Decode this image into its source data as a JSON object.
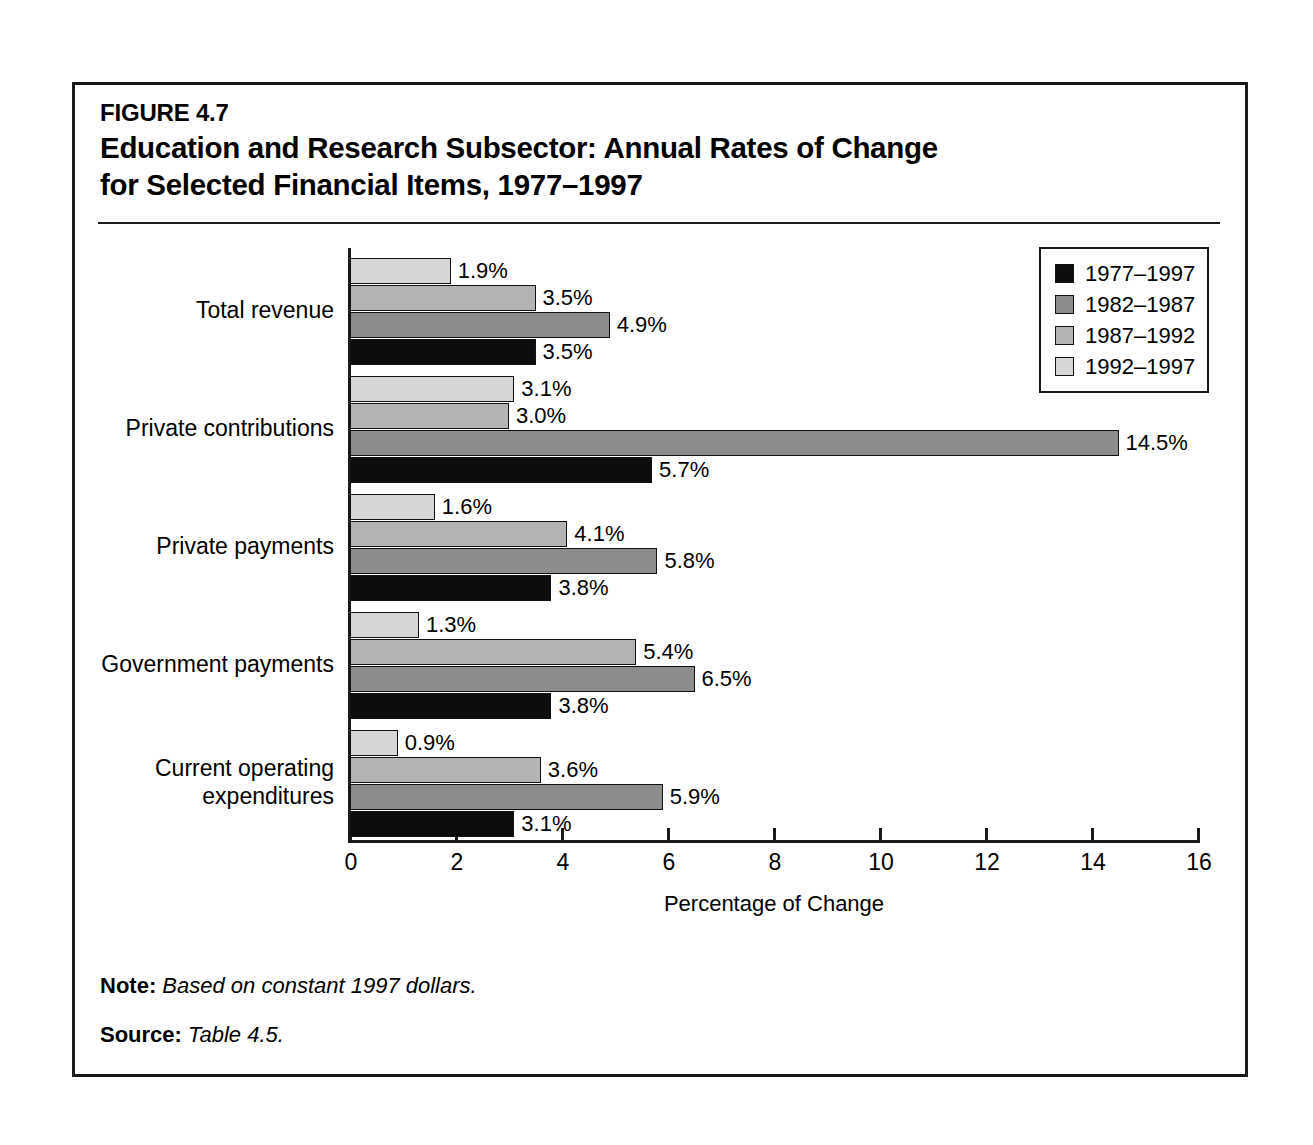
{
  "figure": {
    "number": "FIGURE 4.7",
    "title_line1": "Education and Research Subsector: Annual Rates of Change",
    "title_line2": "for Selected Financial Items, 1977–1997"
  },
  "notes": {
    "note_label": "Note:",
    "note_text": "Based on constant 1997 dollars.",
    "source_label": "Source:",
    "source_text": "Table 4.5."
  },
  "legend": {
    "position": "top-right",
    "entries": [
      {
        "label": "1977–1997",
        "color": "#0d0d0d"
      },
      {
        "label": "1982–1987",
        "color": "#8c8c8c"
      },
      {
        "label": "1987–1992",
        "color": "#b3b3b3"
      },
      {
        "label": "1992–1997",
        "color": "#d6d6d6"
      }
    ]
  },
  "chart_data": {
    "type": "bar",
    "orientation": "horizontal",
    "title": "Education and Research Subsector: Annual Rates of Change for Selected Financial Items, 1977–1997",
    "xlabel": "Percentage of Change",
    "ylabel": "",
    "xlim": [
      0,
      16
    ],
    "xticks": [
      0,
      2,
      4,
      6,
      8,
      10,
      12,
      14,
      16
    ],
    "xtick_labels": [
      "0",
      "2",
      "4",
      "6",
      "8",
      "10",
      "12",
      "14",
      "16"
    ],
    "grid": false,
    "value_label_suffix": "%",
    "categories": [
      "Total revenue",
      "Private contributions",
      "Private payments",
      "Government payments",
      "Current operating\nexpenditures"
    ],
    "series": [
      {
        "name": "1977–1997",
        "color": "#0d0d0d",
        "values": [
          3.5,
          5.7,
          3.8,
          3.8,
          3.1
        ]
      },
      {
        "name": "1982–1987",
        "color": "#8c8c8c",
        "values": [
          4.9,
          14.5,
          5.8,
          6.5,
          5.9
        ]
      },
      {
        "name": "1987–1992",
        "color": "#b3b3b3",
        "values": [
          3.5,
          3.0,
          4.1,
          5.4,
          3.6
        ]
      },
      {
        "name": "1992–1997",
        "color": "#d6d6d6",
        "values": [
          1.9,
          3.1,
          1.6,
          1.3,
          0.9
        ]
      }
    ],
    "value_labels": [
      {
        "category": "Total revenue",
        "series": "1992–1997",
        "text": "1.9%"
      },
      {
        "category": "Total revenue",
        "series": "1987–1992",
        "text": "3.5%"
      },
      {
        "category": "Total revenue",
        "series": "1982–1987",
        "text": "4.9%"
      },
      {
        "category": "Total revenue",
        "series": "1977–1997",
        "text": "3.5%"
      },
      {
        "category": "Private contributions",
        "series": "1992–1997",
        "text": "3.1%"
      },
      {
        "category": "Private contributions",
        "series": "1987–1992",
        "text": "3.0%"
      },
      {
        "category": "Private contributions",
        "series": "1982–1987",
        "text": "14.5%"
      },
      {
        "category": "Private contributions",
        "series": "1977–1997",
        "text": "5.7%"
      },
      {
        "category": "Private payments",
        "series": "1992–1997",
        "text": "1.6%"
      },
      {
        "category": "Private payments",
        "series": "1987–1992",
        "text": "4.1%"
      },
      {
        "category": "Private payments",
        "series": "1982–1987",
        "text": "5.8%"
      },
      {
        "category": "Private payments",
        "series": "1977–1997",
        "text": "3.8%"
      },
      {
        "category": "Government payments",
        "series": "1992–1997",
        "text": "1.3%"
      },
      {
        "category": "Government payments",
        "series": "1987–1992",
        "text": "5.4%"
      },
      {
        "category": "Government payments",
        "series": "1982–1987",
        "text": "6.5%"
      },
      {
        "category": "Government payments",
        "series": "1977–1997",
        "text": "3.8%"
      },
      {
        "category": "Current operating expenditures",
        "series": "1992–1997",
        "text": "0.9%"
      },
      {
        "category": "Current operating expenditures",
        "series": "1987–1992",
        "text": "3.6%"
      },
      {
        "category": "Current operating expenditures",
        "series": "1982–1987",
        "text": "5.9%"
      },
      {
        "category": "Current operating expenditures",
        "series": "1977–1997",
        "text": "3.1%"
      }
    ]
  }
}
